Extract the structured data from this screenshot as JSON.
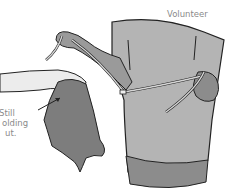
{
  "illustration": {
    "labels": {
      "volunteer": "Volunteer",
      "caption_lines": [
        "Still",
        "olding",
        "ut."
      ]
    },
    "colors": {
      "background": "#ffffff",
      "shirt": "#b4b4b4",
      "shirt_hem": "#8c8c8c",
      "cloth": "#7d7d7d",
      "skin_left": "#ececec",
      "skin_arm": "#9a9a9a",
      "rope": "#d6d6d6",
      "outline": "#222222",
      "label_text": "#8a8a8a"
    }
  }
}
